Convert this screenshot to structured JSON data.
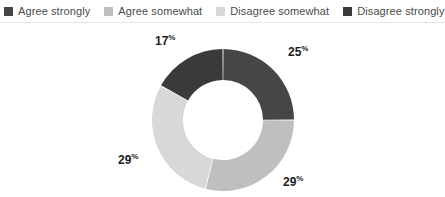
{
  "chart_data": {
    "type": "pie",
    "variant": "donut",
    "title": "",
    "subtitle": "",
    "xlabel": "",
    "ylabel": "",
    "legend_position": "top",
    "grid": false,
    "units": "percent",
    "start_angle_deg": 0,
    "direction": "clockwise",
    "categories": [
      "Agree strongly",
      "Agree somewhat",
      "Disagree somewhat",
      "Disagree strongly"
    ],
    "values": [
      25,
      29,
      29,
      17
    ],
    "labels": [
      "25",
      "29",
      "29",
      "17"
    ],
    "percent_symbol": "%",
    "colors": [
      "#464646",
      "#bfbfbf",
      "#d8d8d8",
      "#3a3a3a"
    ]
  },
  "legend": {
    "items": [
      {
        "label": "Agree strongly",
        "color": "#464646"
      },
      {
        "label": "Agree somewhat",
        "color": "#bfbfbf"
      },
      {
        "label": "Disagree somewhat",
        "color": "#d8d8d8"
      },
      {
        "label": "Disagree strongly",
        "color": "#3a3a3a"
      }
    ]
  },
  "theme": {
    "background": "#ffffff",
    "divider": "#e2e2e2",
    "label_text": "#1d1d1d",
    "legend_text": "#4a4a4a"
  }
}
